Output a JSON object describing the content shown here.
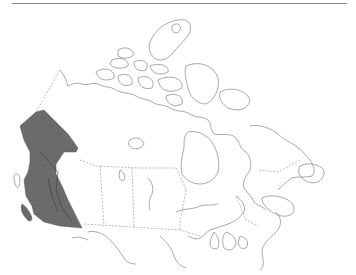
{
  "map": {
    "title": "",
    "region": "Canada",
    "type": "species distribution range map",
    "highlighted_area": "Western Cordillera (Yukon / British Columbia)",
    "colors": {
      "background": "#ffffff",
      "range_fill": "#6b6b6b",
      "coastline": "#6f6f6f",
      "provincial_border": "#8a8a8a",
      "top_rule": "#8a8a8a"
    },
    "legend": []
  }
}
